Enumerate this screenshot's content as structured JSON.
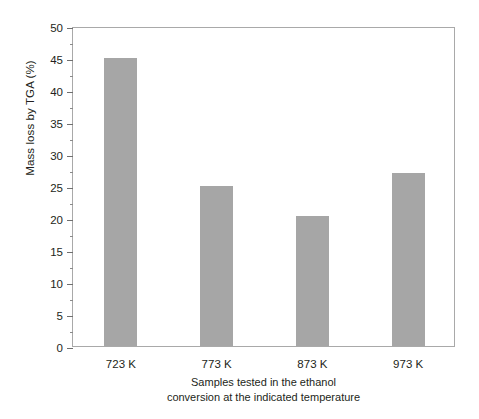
{
  "chart_data": {
    "type": "bar",
    "title": "",
    "categories": [
      "723 K",
      "773 K",
      "873 K",
      "973 K"
    ],
    "values": [
      45,
      25,
      20.3,
      27
    ],
    "series": [
      {
        "name": "Mass loss by TGA (%)",
        "values": [
          45,
          25,
          20.3,
          27
        ]
      }
    ],
    "xlabel_line1": "Samples tested in the ethanol",
    "xlabel_line2": "conversion at the indicated temperature",
    "ylabel": "Mass loss by TGA (%)",
    "ylim": [
      0,
      50
    ],
    "ytick_labels": [
      "0",
      "5",
      "10",
      "15",
      "20",
      "25",
      "30",
      "35",
      "40",
      "45",
      "50"
    ],
    "ytick_values": [
      0,
      5,
      10,
      15,
      20,
      25,
      30,
      35,
      40,
      45,
      50
    ],
    "yminor_values": [
      2.5,
      7.5,
      12.5,
      17.5,
      22.5,
      27.5,
      32.5,
      37.5,
      42.5,
      47.5
    ],
    "grid": false,
    "legend": "none",
    "bar_color": "#a6a6a6",
    "axis_color": "#a9a9a9",
    "text_color": "#231f20",
    "background": "#ffffff"
  }
}
